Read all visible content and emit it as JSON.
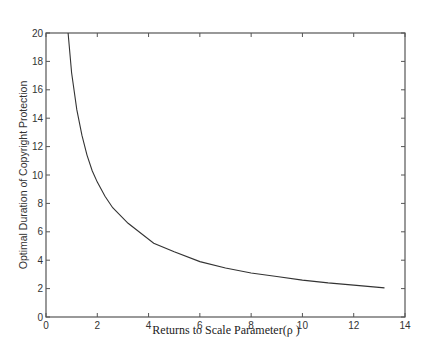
{
  "chart_data": {
    "type": "line",
    "title": "",
    "xlabel": "Returns to Scale Parameter(ρ )",
    "ylabel": "Optimal Duration of Copyright Protection",
    "xlim": [
      0,
      14
    ],
    "ylim": [
      0,
      20
    ],
    "xticks": [
      0,
      2,
      4,
      6,
      8,
      10,
      12,
      14
    ],
    "yticks": [
      0,
      2,
      4,
      6,
      8,
      10,
      12,
      14,
      16,
      18,
      20
    ],
    "grid": false,
    "legend": null,
    "series": [
      {
        "name": "optimal duration",
        "color": "#333333",
        "x": [
          0.86,
          1.0,
          1.2,
          1.4,
          1.6,
          1.8,
          2.0,
          2.3,
          2.6,
          3.2,
          4.2,
          5.0,
          6.0,
          7.0,
          8.0,
          9.0,
          10.0,
          11.0,
          12.0,
          13.2
        ],
        "y": [
          20.0,
          17.2,
          14.6,
          12.8,
          11.4,
          10.3,
          9.5,
          8.5,
          7.7,
          6.6,
          5.2,
          4.6,
          3.9,
          3.45,
          3.1,
          2.85,
          2.6,
          2.4,
          2.25,
          2.05
        ]
      }
    ]
  }
}
